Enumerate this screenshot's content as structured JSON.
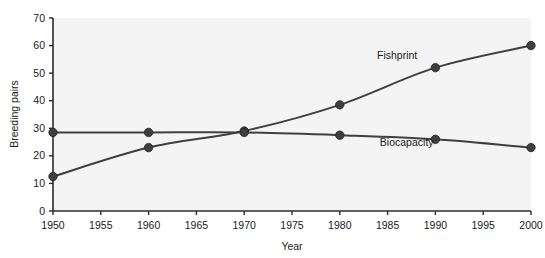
{
  "chart_data": {
    "type": "line",
    "title": "",
    "xlabel": "Year",
    "ylabel": "Breeding pairs",
    "x": [
      1950,
      1960,
      1970,
      1980,
      1990,
      2000
    ],
    "xlim": [
      1950,
      2000
    ],
    "ylim": [
      0,
      70
    ],
    "xticks": [
      "1950",
      "1955",
      "1960",
      "1965",
      "1970",
      "1975",
      "1980",
      "1985",
      "1990",
      "1995",
      "2000"
    ],
    "yticks": [
      "0",
      "10",
      "20",
      "30",
      "40",
      "50",
      "60",
      "70"
    ],
    "grid": false,
    "legend_position": "inline-annotation",
    "series": [
      {
        "name": "Fishprint",
        "values": [
          12.5,
          23,
          29,
          38.5,
          52,
          60
        ],
        "color": "#3f3f3f",
        "label_x": 1986,
        "label_y": 55
      },
      {
        "name": "Biocapacity",
        "values": [
          28.5,
          28.5,
          28.5,
          27.5,
          26,
          23
        ],
        "color": "#3f3f3f",
        "label_x": 1987,
        "label_y": 23.5
      }
    ]
  },
  "style": {
    "plot_background": "#f4f4f4",
    "axis_color": "#2b2b2b",
    "line_color": "#3f3f3f",
    "marker_color": "#3f3f3f",
    "page_background": "#ffffff"
  },
  "axis_titles": {
    "x": "Year",
    "y": "Breeding pairs"
  },
  "ticks": {
    "x": [
      {
        "label": "1950",
        "value": 1950
      },
      {
        "label": "1955",
        "value": 1955
      },
      {
        "label": "1960",
        "value": 1960
      },
      {
        "label": "1965",
        "value": 1965
      },
      {
        "label": "1970",
        "value": 1970
      },
      {
        "label": "1975",
        "value": 1975
      },
      {
        "label": "1980",
        "value": 1980
      },
      {
        "label": "1985",
        "value": 1985
      },
      {
        "label": "1990",
        "value": 1990
      },
      {
        "label": "1995",
        "value": 1995
      },
      {
        "label": "2000",
        "value": 2000
      }
    ],
    "y": [
      {
        "label": "0",
        "value": 0
      },
      {
        "label": "10",
        "value": 10
      },
      {
        "label": "20",
        "value": 20
      },
      {
        "label": "30",
        "value": 30
      },
      {
        "label": "40",
        "value": 40
      },
      {
        "label": "50",
        "value": 50
      },
      {
        "label": "60",
        "value": 60
      },
      {
        "label": "70",
        "value": 70
      }
    ]
  }
}
